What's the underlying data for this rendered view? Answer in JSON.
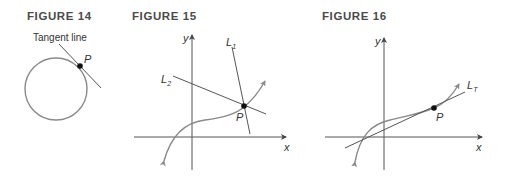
{
  "figures": [
    {
      "title": "FIGURE 14",
      "annotation": "Tangent line",
      "point_label": "P"
    },
    {
      "title": "FIGURE 15",
      "x_axis_label": "x",
      "y_axis_label": "y",
      "point_label": "P",
      "line1_label": "L",
      "line1_sub": "1",
      "line2_label": "L",
      "line2_sub": "2"
    },
    {
      "title": "FIGURE 16",
      "x_axis_label": "x",
      "y_axis_label": "y",
      "point_label": "P",
      "tangent_label": "L",
      "tangent_sub": "T"
    }
  ],
  "colors": {
    "curve": "#8a8a8a",
    "lines": "#555555",
    "point": "#111111"
  }
}
